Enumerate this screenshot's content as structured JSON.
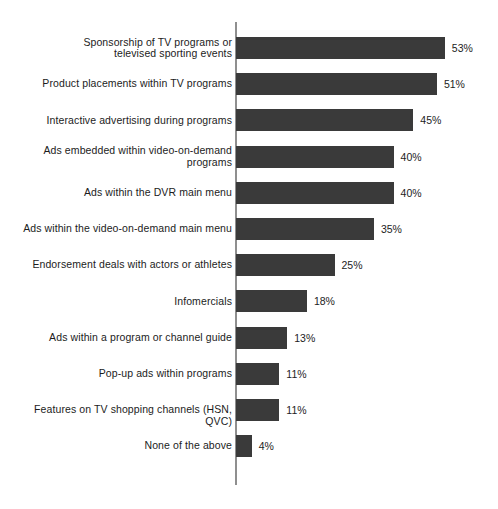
{
  "chart_data": {
    "type": "bar",
    "orientation": "horizontal",
    "title": "",
    "subtitle": "",
    "xlabel": "",
    "ylabel": "",
    "xlim": [
      0,
      53
    ],
    "grid": false,
    "legend": false,
    "value_suffix": "%",
    "bar_color": "#3a3a3a",
    "axis_color": "#8f8f8f",
    "background_color": "#ffffff",
    "categories": [
      "Sponsorship of TV programs or\ntelevised sporting events",
      "Product placements within TV programs",
      "Interactive advertising during programs",
      "Ads embedded within video-on-demand\nprograms",
      "Ads within the DVR main menu",
      "Ads within the video-on-demand main menu",
      "Endorsement deals with actors or athletes",
      "Infomercials",
      "Ads within a program or channel guide",
      "Pop-up ads within programs",
      "Features on TV shopping channels (HSN, QVC)",
      "None of the above"
    ],
    "values": [
      53,
      51,
      45,
      40,
      40,
      35,
      25,
      18,
      13,
      11,
      11,
      4
    ],
    "value_labels": [
      "53%",
      "51%",
      "45%",
      "40%",
      "40%",
      "35%",
      "25%",
      "18%",
      "13%",
      "11%",
      "11%",
      "4%"
    ]
  }
}
